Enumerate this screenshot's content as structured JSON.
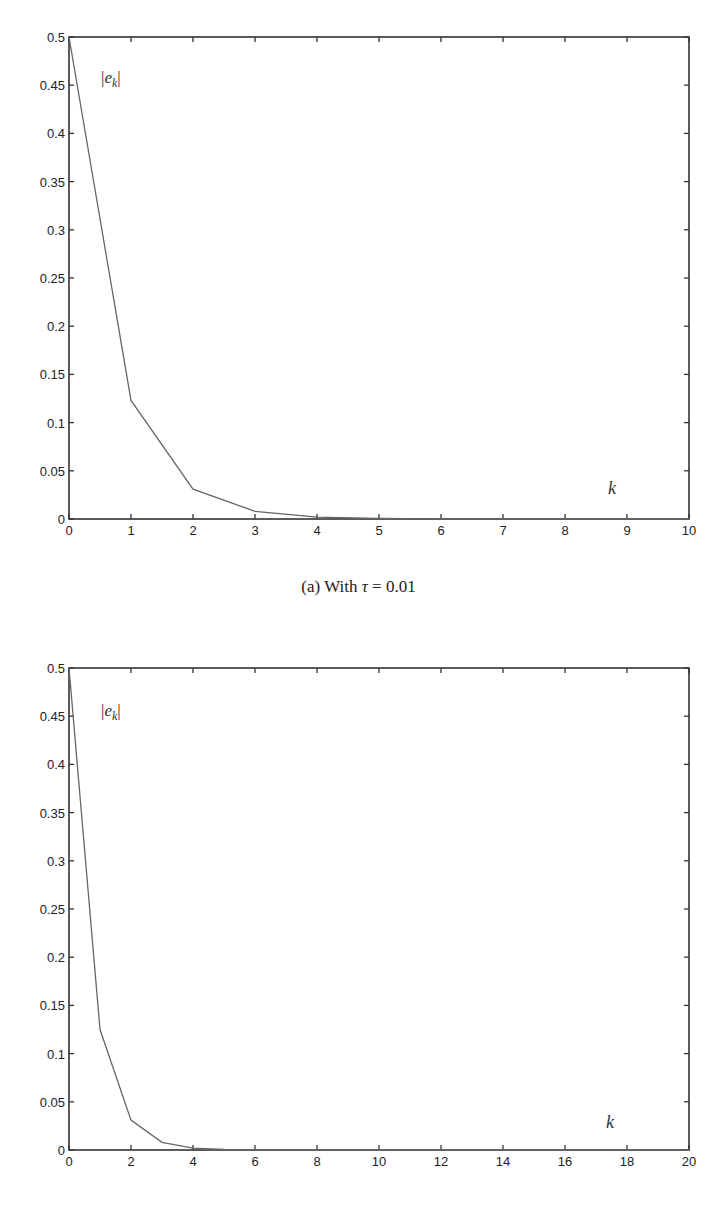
{
  "header": {
    "running_text": ""
  },
  "chart_data": [
    {
      "type": "line",
      "title": "",
      "caption": "(a) With τ = 0.01",
      "xlabel": "k",
      "ylabel": "|e_k|",
      "xlim": [
        0,
        10
      ],
      "ylim": [
        0,
        0.5
      ],
      "xticks": [
        0,
        1,
        2,
        3,
        4,
        5,
        6,
        7,
        8,
        9,
        10
      ],
      "yticks": [
        0,
        0.05,
        0.1,
        0.15,
        0.2,
        0.25,
        0.3,
        0.35,
        0.4,
        0.45,
        0.5
      ],
      "grid": false,
      "series": [
        {
          "name": "|e_k|",
          "x": [
            0,
            1,
            2,
            3,
            4,
            5,
            6,
            7,
            8,
            9,
            10
          ],
          "values": [
            0.5,
            0.123,
            0.031,
            0.008,
            0.002,
            0.0005,
            0.0001,
            0,
            0,
            0,
            0
          ]
        }
      ]
    },
    {
      "type": "line",
      "title": "",
      "caption": "",
      "xlabel": "k",
      "ylabel": "|e_k|",
      "xlim": [
        0,
        20
      ],
      "ylim": [
        0,
        0.5
      ],
      "xticks": [
        0,
        2,
        4,
        6,
        8,
        10,
        12,
        14,
        16,
        18,
        20
      ],
      "yticks": [
        0,
        0.05,
        0.1,
        0.15,
        0.2,
        0.25,
        0.3,
        0.35,
        0.4,
        0.45,
        0.5
      ],
      "grid": false,
      "series": [
        {
          "name": "|e_k|",
          "x": [
            0,
            1,
            2,
            3,
            4,
            5,
            6,
            7,
            8,
            9,
            10,
            11,
            12,
            13,
            14,
            15,
            16,
            17,
            18,
            19,
            20
          ],
          "values": [
            0.5,
            0.125,
            0.031,
            0.008,
            0.002,
            0.0005,
            0.0001,
            0,
            0,
            0,
            0,
            0,
            0,
            0,
            0,
            0,
            0,
            0,
            0,
            0,
            0
          ]
        }
      ]
    }
  ],
  "captions": {
    "a_prefix": "(a) With ",
    "a_symbol": "τ",
    "a_rest": " = 0.01"
  }
}
